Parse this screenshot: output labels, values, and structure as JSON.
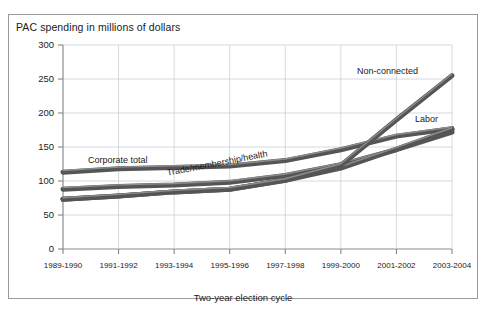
{
  "figure": {
    "title": "PAC spending in millions of dollars",
    "xaxis_title": "Two-year election cycle"
  },
  "axis": {
    "y_ticks": [
      "300",
      "250",
      "200",
      "150",
      "100",
      "50",
      "0"
    ],
    "x_ticks": [
      "1989-1990",
      "1991-1992",
      "1993-1994",
      "1995-1996",
      "1997-1998",
      "1999-2000",
      "2001-2002",
      "2003-2004"
    ]
  },
  "series_labels": {
    "corporate": "Corporate total",
    "trade": "Trade/membership/health",
    "nonconnected": "Non-connected",
    "labor": "Labor"
  },
  "colors": {
    "line": "#555555",
    "line_highlight": "#8d8d8d",
    "grid": "#c9cfd8",
    "frame": "#9a9a9a",
    "text": "#1a1a1a",
    "background": "#ffffff"
  },
  "chart_data": {
    "type": "line",
    "title": "PAC spending in millions of dollars",
    "xlabel": "Two-year election cycle",
    "ylabel": "PAC spending in millions of dollars",
    "ylim": [
      0,
      300
    ],
    "ytick_step": 50,
    "grid": true,
    "legend": "inline-annotations",
    "categories": [
      "1989-1990",
      "1991-1992",
      "1993-1994",
      "1995-1996",
      "1997-1998",
      "1999-2000",
      "2001-2002",
      "2003-2004"
    ],
    "series": [
      {
        "name": "Corporate total",
        "values": [
          113,
          118,
          120,
          122,
          130,
          146,
          166,
          177
        ]
      },
      {
        "name": "Trade/membership/health",
        "values": [
          88,
          92,
          94,
          98,
          108,
          124,
          146,
          172
        ]
      },
      {
        "name": "Labor",
        "values": [
          73,
          78,
          84,
          88,
          101,
          119,
          147,
          176
        ]
      },
      {
        "name": "Non-connected",
        "values": [
          73,
          78,
          84,
          88,
          101,
          123,
          190,
          255
        ]
      }
    ]
  }
}
